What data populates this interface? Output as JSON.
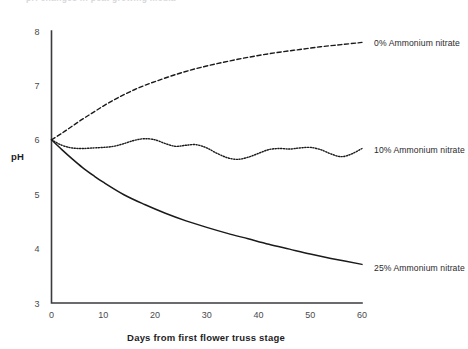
{
  "page": {
    "clipped_header_text": "pH changes in peat growing media",
    "background_color": "#ffffff",
    "ink_color": "#1a1a1c"
  },
  "chart_data": {
    "type": "line",
    "title": "",
    "xlabel": "Days from first flower truss stage",
    "ylabel": "pH",
    "xlim": [
      0,
      60
    ],
    "ylim": [
      3,
      8
    ],
    "xticks": [
      0,
      10,
      20,
      30,
      40,
      50,
      60
    ],
    "yticks": [
      3,
      4,
      5,
      6,
      7,
      8
    ],
    "xtick_labels": [
      "0",
      "10",
      "20",
      "30",
      "40",
      "50",
      "60"
    ],
    "ytick_labels": [
      "3",
      "4",
      "5",
      "6",
      "7",
      "8"
    ],
    "grid": false,
    "legend_position": "right-inline",
    "series": [
      {
        "name": "0% Ammonium nitrate",
        "label": "0% Ammonium nitrate",
        "style": "dashed",
        "color": "#1a1a1c",
        "label_x": 62,
        "label_y": 7.78,
        "x": [
          0,
          2,
          4,
          6,
          8,
          10,
          12,
          14,
          16,
          18,
          20,
          24,
          28,
          32,
          36,
          40,
          44,
          48,
          52,
          56,
          60
        ],
        "y": [
          6.0,
          6.12,
          6.25,
          6.38,
          6.5,
          6.62,
          6.73,
          6.83,
          6.92,
          7.0,
          7.07,
          7.2,
          7.31,
          7.4,
          7.48,
          7.55,
          7.61,
          7.66,
          7.71,
          7.75,
          7.79
        ]
      },
      {
        "name": "10% Ammonium nitrate",
        "label": "10% Ammonium nitrate",
        "style": "dotted",
        "color": "#1a1a1c",
        "label_x": 62,
        "label_y": 5.82,
        "x": [
          0,
          2,
          4,
          6,
          8,
          10,
          12,
          14,
          16,
          18,
          20,
          22,
          24,
          26,
          28,
          30,
          32,
          34,
          36,
          38,
          40,
          42,
          44,
          46,
          48,
          50,
          52,
          54,
          56,
          58,
          60
        ],
        "y": [
          6.0,
          5.9,
          5.85,
          5.84,
          5.85,
          5.86,
          5.88,
          5.93,
          5.99,
          6.02,
          6.0,
          5.93,
          5.88,
          5.9,
          5.91,
          5.85,
          5.75,
          5.67,
          5.64,
          5.68,
          5.75,
          5.82,
          5.84,
          5.83,
          5.85,
          5.86,
          5.82,
          5.74,
          5.69,
          5.74,
          5.84
        ]
      },
      {
        "name": "25% Ammonium nitrate",
        "label": "25% Ammonium nitrate",
        "style": "solid",
        "color": "#1a1a1c",
        "label_x": 62,
        "label_y": 3.64,
        "x": [
          0,
          2,
          4,
          6,
          8,
          10,
          14,
          18,
          22,
          26,
          30,
          34,
          38,
          42,
          46,
          50,
          54,
          60
        ],
        "y": [
          6.0,
          5.82,
          5.65,
          5.49,
          5.35,
          5.22,
          4.99,
          4.81,
          4.65,
          4.51,
          4.39,
          4.28,
          4.18,
          4.08,
          3.99,
          3.9,
          3.82,
          3.71
        ]
      }
    ]
  }
}
